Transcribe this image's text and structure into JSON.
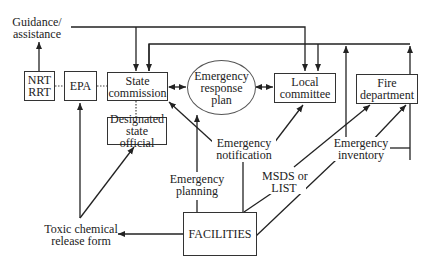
{
  "diagram": {
    "nodes": {
      "nrt_rrt": {
        "line1": "NRT",
        "line2": "RRT"
      },
      "epa": {
        "label": "EPA"
      },
      "state_commission": {
        "line1": "State",
        "line2": "commission"
      },
      "emergency_response_plan": {
        "line1": "Emergency",
        "line2": "response",
        "line3": "plan"
      },
      "local_committee": {
        "line1": "Local",
        "line2": "committee"
      },
      "fire_department": {
        "line1": "Fire",
        "line2": "department"
      },
      "designated_state_official": {
        "line1": "Designated",
        "line2": "state official"
      },
      "facilities": {
        "label": "FACILITIES"
      }
    },
    "labels": {
      "guidance": {
        "line1": "Guidance/",
        "line2": "assistance"
      },
      "emergency_notification": {
        "line1": "Emergency",
        "line2": "notification"
      },
      "emergency_planning": {
        "line1": "Emergency",
        "line2": "planning"
      },
      "msds": {
        "line1": "MSDS or",
        "line2": "LIST"
      },
      "emergency_inventory": {
        "line1": "Emergency",
        "line2": "inventory"
      },
      "toxic_release": {
        "line1": "Toxic chemical",
        "line2": "release form"
      }
    },
    "edges": [
      {
        "from": "NRT/RRT",
        "to": "Guidance/assistance",
        "style": "solid-arrow"
      },
      {
        "from": "Guidance/assistance",
        "to": "State commission",
        "style": "solid-arrow"
      },
      {
        "from": "Guidance/assistance",
        "to": "Local committee",
        "style": "solid-arrow"
      },
      {
        "from": "NRT/RRT",
        "to": "EPA",
        "style": "dotted"
      },
      {
        "from": "EPA",
        "to": "State commission",
        "style": "dotted"
      },
      {
        "from": "State commission",
        "to": "Designated state official",
        "style": "dotted"
      },
      {
        "from": "State commission",
        "to": "Emergency response plan",
        "style": "double-arrow"
      },
      {
        "from": "Emergency response plan",
        "to": "Local committee",
        "style": "double-arrow"
      },
      {
        "from": "Emergency notification",
        "to": "State commission",
        "style": "solid-arrow"
      },
      {
        "from": "Emergency notification",
        "to": "Local committee",
        "style": "solid-arrow"
      },
      {
        "from": "Emergency planning",
        "to": "Emergency response plan",
        "style": "solid-arrow"
      },
      {
        "from": "FACILITIES",
        "to": "Fire department",
        "label": "MSDS or LIST",
        "style": "solid-arrow"
      },
      {
        "from": "FACILITIES",
        "to": "Fire department",
        "label": "Emergency inventory",
        "style": "solid-arrow"
      },
      {
        "from": "FACILITIES",
        "to": "Toxic chemical release form",
        "style": "solid-arrow"
      },
      {
        "from": "Toxic chemical release form",
        "to": "EPA",
        "style": "solid-arrow"
      },
      {
        "from": "Toxic chemical release form",
        "to": "Designated state official",
        "style": "solid-arrow"
      }
    ]
  }
}
